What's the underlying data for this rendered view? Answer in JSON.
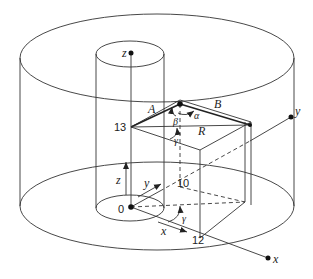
{
  "figure": {
    "type": "3D geometry diagram",
    "labels": {
      "z_top": "z",
      "y_axis": "y",
      "x_axis": "x",
      "z_arrow": "z",
      "y_arrow": "y",
      "x_arrow": "x",
      "origin": "0",
      "height_13": "13",
      "y_10": "10",
      "x_12": "12",
      "vector_A": "A",
      "vector_B": "B",
      "vector_R": "R",
      "angle_alpha": "α",
      "angle_beta": "β",
      "angle_gamma_top": "γ",
      "angle_gamma_bottom": "γ"
    },
    "colors": {
      "line": "#333333",
      "background": "#ffffff"
    }
  }
}
